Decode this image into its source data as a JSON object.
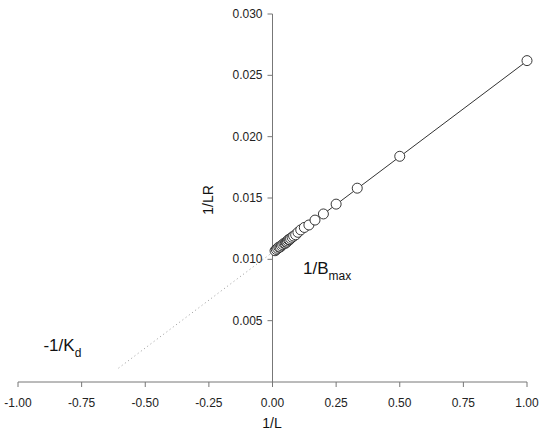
{
  "chart_data": {
    "type": "scatter",
    "title": "",
    "xlabel": "1/L",
    "ylabel": "1/LR",
    "xlim": [
      -1.0,
      1.0
    ],
    "ylim": [
      0.0,
      0.03
    ],
    "grid": false,
    "legend": null,
    "x_ticks": [
      "-1.00",
      "-0.75",
      "-0.50",
      "-0.25",
      "0.00",
      "0.25",
      "0.50",
      "0.75",
      "1.00"
    ],
    "x_tick_values": [
      -1.0,
      -0.75,
      -0.5,
      -0.25,
      0.0,
      0.25,
      0.5,
      0.75,
      1.0
    ],
    "y_ticks": [
      "0.005",
      "0.010",
      "0.015",
      "0.020",
      "0.025",
      "0.030"
    ],
    "y_tick_values": [
      0.005,
      0.01,
      0.015,
      0.02,
      0.025,
      0.03
    ],
    "series": [
      {
        "name": "data",
        "marker": "open-circle",
        "x": [
          1.0,
          0.5,
          0.333,
          0.25,
          0.2,
          0.167,
          0.143,
          0.125,
          0.111,
          0.1,
          0.091,
          0.083,
          0.077,
          0.071,
          0.067,
          0.063,
          0.059,
          0.056,
          0.053,
          0.05,
          0.045,
          0.04,
          0.035,
          0.03,
          0.025,
          0.02,
          0.015,
          0.01
        ],
        "y": [
          0.0262,
          0.0184,
          0.0158,
          0.0145,
          0.0137,
          0.0132,
          0.0128,
          0.0126,
          0.0124,
          0.0122,
          0.012,
          0.0119,
          0.0118,
          0.0117,
          0.0116,
          0.0116,
          0.0115,
          0.0114,
          0.0114,
          0.0113,
          0.0113,
          0.0112,
          0.0111,
          0.011,
          0.011,
          0.0109,
          0.0108,
          0.0107
        ]
      }
    ],
    "fit_line": {
      "slope": 0.0156,
      "intercept": 0.01057,
      "x_range": [
        0.0,
        1.0
      ],
      "style": "solid"
    },
    "extrapolation": {
      "x_range": [
        -0.605,
        0.0
      ],
      "style": "dotted"
    },
    "annotations": [
      {
        "text": "1/B",
        "sub": "max",
        "x": 0.12,
        "y": 0.0088
      },
      {
        "text": "-1/K",
        "sub": "d",
        "x": -0.9,
        "y": 0.0025
      }
    ]
  }
}
